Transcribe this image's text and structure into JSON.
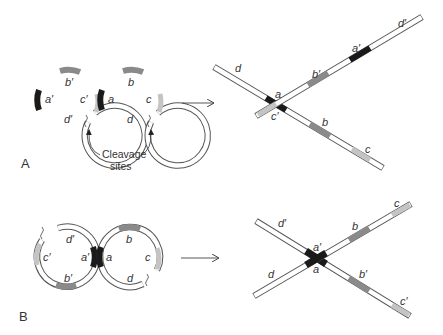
{
  "figure": {
    "panels": [
      {
        "id": "A",
        "label": "A",
        "before": {
          "circles": [
            {
              "name": "left",
              "segments": [
                "a'",
                "b'",
                "c'",
                "d'"
              ]
            },
            {
              "name": "right",
              "segments": [
                "a",
                "b",
                "c",
                "d"
              ]
            }
          ],
          "annotation": "Cleavage sites",
          "annotation_line1": "Cleavage",
          "annotation_line2": "sites"
        },
        "after": {
          "strands": [
            {
              "labels": [
                "d",
                "a",
                "b",
                "c"
              ]
            },
            {
              "labels": [
                "c'",
                "b'",
                "a'",
                "d'"
              ]
            }
          ]
        }
      },
      {
        "id": "B",
        "label": "B",
        "before": {
          "circles": [
            {
              "name": "left",
              "segments": [
                "a'",
                "b'",
                "c'",
                "d'"
              ]
            },
            {
              "name": "right",
              "segments": [
                "a",
                "b",
                "c",
                "d"
              ]
            }
          ]
        },
        "after": {
          "strands": [
            {
              "labels": [
                "d'",
                "a'",
                "b'",
                "c'"
              ]
            },
            {
              "labels": [
                "d",
                "a",
                "b",
                "c"
              ]
            }
          ]
        }
      }
    ],
    "labels": {
      "A": {
        "a_p": "a′",
        "b_p": "b′",
        "c_p": "c′",
        "d_p": "d′",
        "a": "a",
        "b": "b",
        "c": "c",
        "d": "d",
        "x_d": "d",
        "x_a": "a",
        "x_cp": "c′",
        "x_bp": "b′",
        "x_ap": "a′",
        "x_dp": "d′",
        "x_b": "b",
        "x_c": "c"
      },
      "B": {
        "a_p": "a′",
        "b_p": "b′",
        "c_p": "c′",
        "d_p": "d′",
        "a": "a",
        "b": "b",
        "c": "c",
        "d": "d",
        "x_dp": "d′",
        "x_ap": "a′",
        "x_a": "a",
        "x_d": "d",
        "x_b": "b",
        "x_c": "c",
        "x_bp": "b′",
        "x_cp": "c′"
      }
    },
    "colors": {
      "a_segment": "#1a1a1a",
      "b_segment": "#8a8a8a",
      "c_segment": "#c4c4c4",
      "strand_fill": "#ffffff",
      "strand_outline": "#555555"
    }
  }
}
